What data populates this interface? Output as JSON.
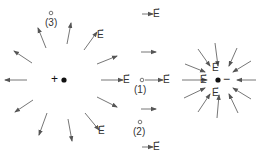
{
  "diagram": {
    "title": "",
    "charges": [
      {
        "id": "positive",
        "sign_label": "+",
        "x": 64,
        "y": 80
      },
      {
        "id": "negative",
        "sign_label": "−",
        "x": 218,
        "y": 80
      }
    ],
    "points": [
      {
        "id": "p1",
        "label": "(1)",
        "x": 142,
        "y": 80
      },
      {
        "id": "p2",
        "label": "(2)",
        "x": 140,
        "y": 122
      },
      {
        "id": "p3",
        "label": "(3)",
        "x": 51,
        "y": 13
      }
    ],
    "field_label": "E",
    "vector_arrow": "→",
    "colors": {
      "arrow": "#555555",
      "text": "#333333",
      "charge": "#111111"
    }
  }
}
